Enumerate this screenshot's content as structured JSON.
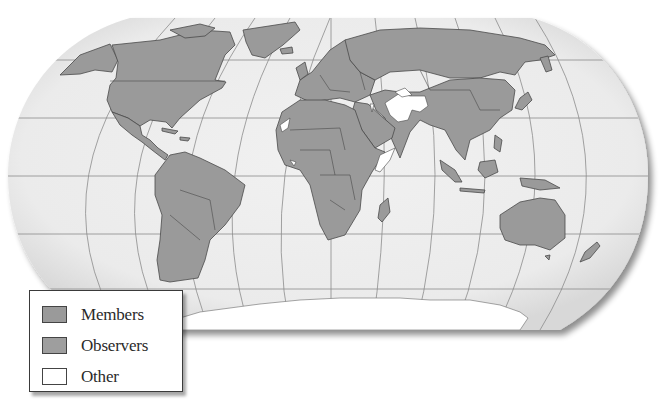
{
  "map": {
    "projection": "robinson",
    "colors": {
      "ocean": "#ececec",
      "members": "#9a9a9a",
      "observers": "#9a9a9a",
      "other": "#ffffff",
      "borders": "#4a4a4a",
      "graticule": "#8c8c8c"
    },
    "other_regions": [
      "Iran",
      "Afghanistan",
      "Turkmenistan (part)",
      "Somalia coast",
      "Western Sahara",
      "Israel",
      "North Korea (part)",
      "Antarctica"
    ]
  },
  "legend": {
    "items": [
      {
        "label": "Members",
        "color": "#9a9a9a"
      },
      {
        "label": "Observers",
        "color": "#9e9e9e"
      },
      {
        "label": "Other",
        "color": "#ffffff"
      }
    ]
  }
}
